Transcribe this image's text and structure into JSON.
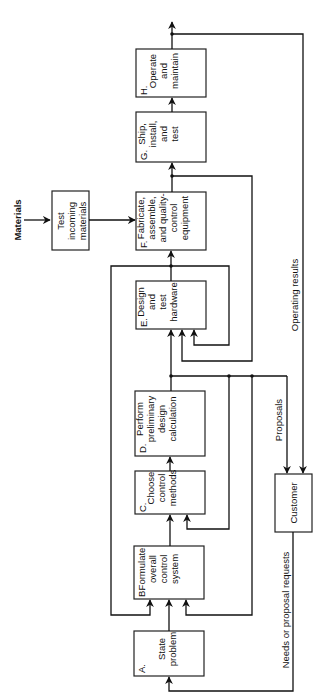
{
  "boxes": {
    "A": {
      "letter": "A.",
      "lines": [
        "State",
        "problem"
      ]
    },
    "B": {
      "letter": "B.",
      "lines": [
        "Formulate",
        "overall",
        "control",
        "system"
      ]
    },
    "C": {
      "letter": "C.",
      "lines": [
        "Choose",
        "control",
        "methods"
      ]
    },
    "D": {
      "letter": "D.",
      "lines": [
        "Perform",
        "preliminary",
        "design",
        "calculation"
      ]
    },
    "E": {
      "letter": "E.",
      "lines": [
        "Design",
        "and",
        "test",
        "hardware"
      ]
    },
    "F": {
      "letter": "F.",
      "lines": [
        "Fabricate,",
        "assemble,",
        "and quality-",
        "control",
        "equipment"
      ]
    },
    "G": {
      "letter": "G.",
      "lines": [
        "Ship,",
        "install,",
        "and",
        "test"
      ]
    },
    "H": {
      "letter": "H.",
      "lines": [
        "Operate",
        "and",
        "maintain"
      ]
    },
    "test": {
      "lines": [
        "Test",
        "incoming",
        "materials"
      ]
    },
    "customer": {
      "lines": [
        "Customer"
      ]
    }
  },
  "labels": {
    "materials": "Materials",
    "operating_results": "Operating results",
    "proposals": "Proposals",
    "needs": "Needs or proposal requests"
  }
}
